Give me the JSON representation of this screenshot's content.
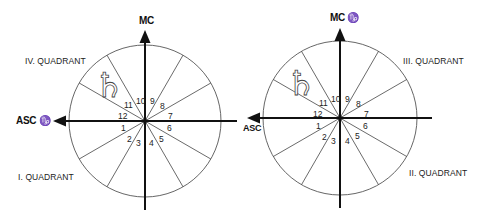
{
  "diagrams": [
    {
      "id": "left",
      "top_label": "MC",
      "left_label": "ASC ♑",
      "quadrant_labels": {
        "upper_left": "IV. QUADRANT",
        "lower_left": "I. QUADRANT"
      },
      "houses": [
        "1",
        "2",
        "3",
        "4",
        "5",
        "6",
        "7",
        "8",
        "9",
        "10",
        "11",
        "12"
      ],
      "planet_glyph": "♄",
      "planet_name": "saturn"
    },
    {
      "id": "right",
      "top_label": "MC ♑",
      "left_label": "ASC",
      "quadrant_labels": {
        "upper_right": "III. QUADRANT",
        "lower_right": "II. QUADRANT"
      },
      "houses": [
        "1",
        "2",
        "3",
        "4",
        "5",
        "6",
        "7",
        "8",
        "9",
        "10",
        "11",
        "12"
      ],
      "planet_glyph": "♄",
      "planet_name": "saturn"
    }
  ],
  "colors": {
    "line": "#1a1a1a",
    "background": "#ffffff"
  }
}
